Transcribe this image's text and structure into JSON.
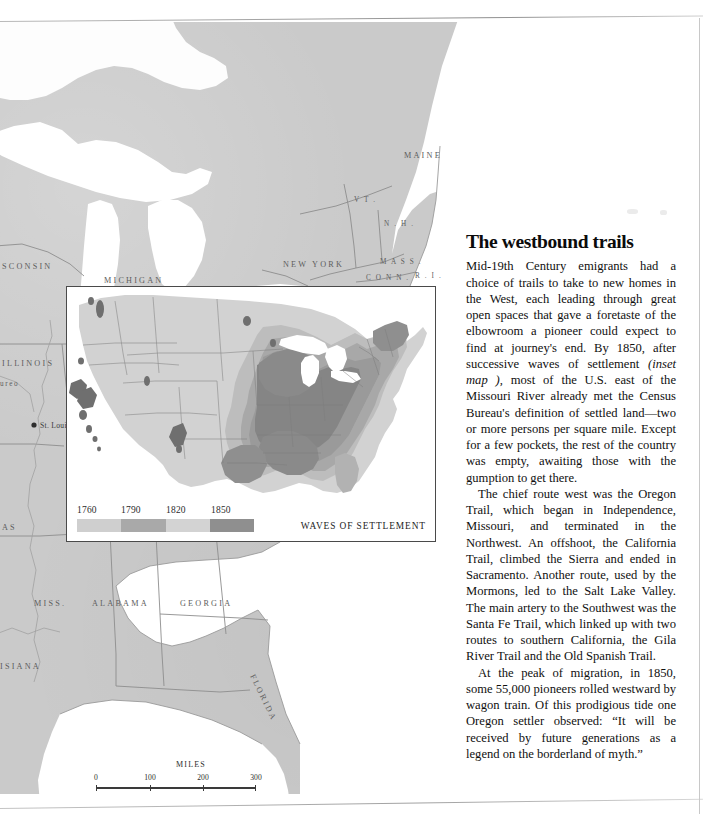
{
  "page": {
    "kind": "printed-book-page",
    "background_color": "#ffffff"
  },
  "base_map": {
    "name": "eastern-united-states-base-map",
    "land_color": "#cacaca",
    "water_color": "#ffffff",
    "border_color": "#8b8b8b",
    "labels": [
      {
        "text": "MAINE",
        "x": 404,
        "y": 144,
        "size": "normal"
      },
      {
        "text": "V T .",
        "x": 354,
        "y": 188,
        "size": "small"
      },
      {
        "text": "N . H .",
        "x": 384,
        "y": 212,
        "size": "small"
      },
      {
        "text": "M A S S .",
        "x": 380,
        "y": 250,
        "size": "small"
      },
      {
        "text": "C O N N .",
        "x": 366,
        "y": 266,
        "size": "small"
      },
      {
        "text": "R . I .",
        "x": 415,
        "y": 264,
        "size": "small"
      },
      {
        "text": "NEW YORK",
        "x": 283,
        "y": 253,
        "size": "normal"
      },
      {
        "text": "MICHIGAN",
        "x": 104,
        "y": 269,
        "size": "normal"
      },
      {
        "text": "SCONSIN",
        "x": 2,
        "y": 255,
        "size": "normal"
      },
      {
        "text": "ILLINOIS",
        "x": 2,
        "y": 352,
        "size": "normal"
      },
      {
        "text": "ureo",
        "x": 0,
        "y": 372,
        "size": "small"
      },
      {
        "text": "AS",
        "x": 2,
        "y": 516,
        "size": "normal"
      },
      {
        "text": "MISS.",
        "x": 34,
        "y": 592,
        "size": "normal"
      },
      {
        "text": "ALABAMA",
        "x": 92,
        "y": 592,
        "size": "normal"
      },
      {
        "text": "GEORGIA",
        "x": 180,
        "y": 592,
        "size": "normal"
      },
      {
        "text": "ISIANA",
        "x": 0,
        "y": 655,
        "size": "normal"
      },
      {
        "text": "FLORIDA",
        "x": 250,
        "y": 662,
        "size": "normal"
      }
    ],
    "cities": [
      {
        "name": "St. Louis",
        "x": 40,
        "y": 414
      }
    ]
  },
  "inset": {
    "title": "WAVES OF SETTLEMENT",
    "map_name": "united-states-waves-of-settlement",
    "legend": {
      "years": [
        "1760",
        "1790",
        "1820",
        "1850"
      ],
      "colors": [
        "#cfcfcf",
        "#a9a9a9",
        "#d3d3d3",
        "#8f8f8f"
      ]
    },
    "shade_scale": {
      "unsettled": "#d2d2d2",
      "wave_1760": "#bdbdbd",
      "wave_1790": "#a8a8a8",
      "wave_1820": "#9a9a9a",
      "wave_1850": "#858585"
    }
  },
  "scalebar": {
    "title": "MILES",
    "ticks": [
      "0",
      "100",
      "200",
      "300"
    ]
  },
  "article": {
    "title": "The westbound trails",
    "paragraphs": [
      {
        "runs": [
          {
            "type": "text",
            "text": "Mid-19th Century emigrants had a choice of trails to take to new homes in the West, each leading through great open spaces that gave a foretaste of the elbowroom a pioneer could expect to find at journey's end. By 1850, after successive waves of settlement "
          },
          {
            "type": "italic",
            "text": "(inset map ),"
          },
          {
            "type": "text",
            "text": " most of the U.S. east of the Missouri River already met the Census Bureau's definition of settled land—two or more persons per square mile. Except for a few pockets, the rest of the country was empty, awaiting those with the gumption to get there."
          }
        ]
      },
      {
        "runs": [
          {
            "type": "text",
            "text": "The chief route west was the Oregon Trail, which began in Independence, Missouri, and terminated in the Northwest. An offshoot, the California Trail, climbed the Sierra and ended in Sacramento. Another route, used by the Mormons, led to the Salt Lake Valley. The main artery to the Southwest was the Santa Fe Trail, which linked up with two routes to southern California, the Gila River Trail and the Old Spanish Trail."
          }
        ]
      },
      {
        "runs": [
          {
            "type": "text",
            "text": "At the peak of migration, in 1850, some 55,000 pioneers rolled westward by wagon train. Of this prodigious tide one Oregon settler observed: “It will be received by future generations as a legend on the borderland of myth.”"
          }
        ]
      }
    ]
  }
}
